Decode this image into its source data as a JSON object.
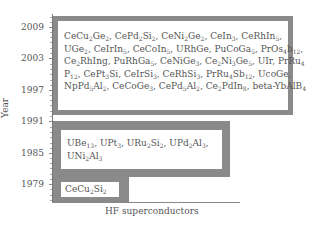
{
  "chart_data": {
    "type": "diagram",
    "title": "",
    "xlabel": "HF superconductors",
    "ylabel": "Year",
    "y_ticks": [
      "2009",
      "2003",
      "1997",
      "1991",
      "1985",
      "1979"
    ],
    "groups": [
      {
        "period": "1979",
        "materials": [
          "CeCu2Si2"
        ]
      },
      {
        "period": "1979-1991",
        "materials": [
          "UBe13",
          "UPt3",
          "URu2Si2",
          "UPd2Al3",
          "UNi2Al3"
        ]
      },
      {
        "period": "1991-2009",
        "materials": [
          "CeCu2Ge2",
          "CePd2Si2",
          "CeNi2Ge2",
          "CeIn3",
          "CeRhIn5",
          "UGe2",
          "CeIrIn5",
          "CeCoIn5",
          "URhGe",
          "PuCoGa5",
          "PrOs4Sb12",
          "Ce2RhIn8",
          "PuRhGa5",
          "CeNiGe3",
          "Ce2Ni3Ge5",
          "UIr",
          "PrRu4P12",
          "CePt3Si",
          "CeIrSi3",
          "CeRhSi3",
          "PrRu4Sb12",
          "UCoGe",
          "NpPd5Al2",
          "CeCoGe3",
          "CePd5Al2",
          "Ce2PdIn8",
          "beta-YbAlB4"
        ]
      }
    ]
  },
  "axis": {
    "y_label": "Year",
    "x_label": "HF superconductors",
    "ticks": [
      "2009",
      "2003",
      "1997",
      "1991",
      "1985",
      "1979"
    ]
  },
  "colors": {
    "box_border": "#8a8a8a",
    "text": "#555555"
  }
}
